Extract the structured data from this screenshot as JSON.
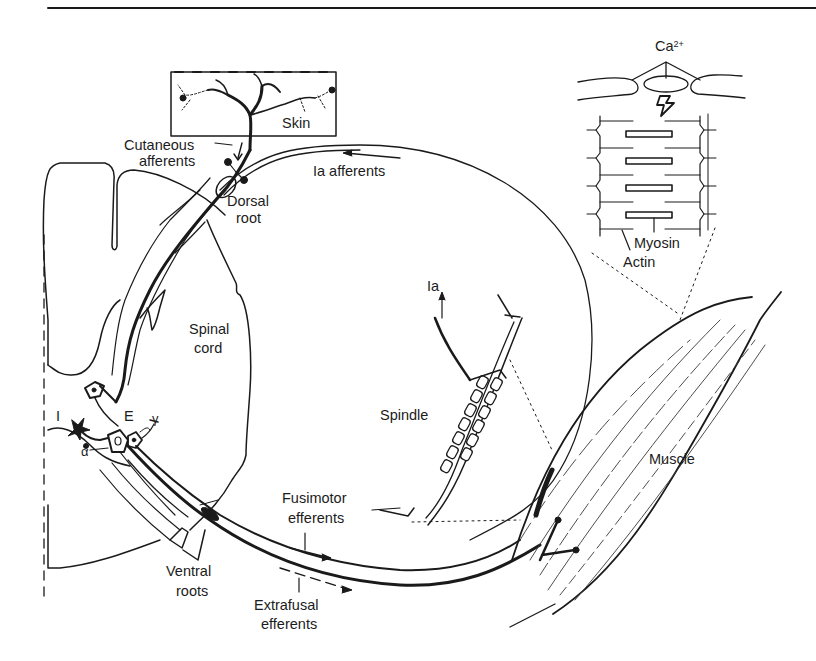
{
  "figure": {
    "colors": {
      "ink": "#1a1a1a",
      "paper": "#ffffff"
    },
    "labels": {
      "skin": "Skin",
      "cutaneous_afferents_1": "Cutaneous",
      "cutaneous_afferents_2": "afferents",
      "ia_afferents": "Ia afferents",
      "dorsal_root_1": "Dorsal",
      "dorsal_root_2": "root",
      "spinal_cord_1": "Spinal",
      "spinal_cord_2": "cord",
      "inhibitory": "I",
      "excitatory": "E",
      "alpha": "α",
      "gamma": "γ",
      "ventral_roots_1": "Ventral",
      "ventral_roots_2": "roots",
      "fusimotor_efferents_1": "Fusimotor",
      "fusimotor_efferents_2": "efferents",
      "extrafusal_efferents_1": "Extrafusal",
      "extrafusal_efferents_2": "efferents",
      "spindle": "Spindle",
      "ia": "Ia",
      "muscle": "Muscle",
      "calcium": "Ca",
      "calcium_charge": "2+",
      "myosin": "Myosin",
      "actin": "Actin"
    }
  }
}
